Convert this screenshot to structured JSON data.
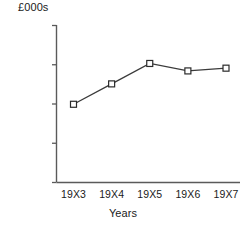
{
  "chart_data": {
    "type": "line",
    "title": "",
    "xlabel": "Years",
    "ylabel": "£000s",
    "categories": [
      "19X3",
      "19X4",
      "19X5",
      "19X6",
      "19X7"
    ],
    "values": [
      19800,
      25000,
      30200,
      28300,
      29000
    ],
    "series": [
      {
        "name": "",
        "values": [
          19800,
          25000,
          30200,
          28300,
          29000
        ]
      }
    ],
    "ylim": [
      0,
      40000
    ],
    "yticks": [
      0,
      10000,
      20000,
      30000,
      40000
    ],
    "ytick_labels": [
      "0",
      "10 000",
      "20 000",
      "30 000",
      "40 000"
    ],
    "grid": false,
    "legend": false,
    "legend_position": "none",
    "marker": "open-square",
    "line_color": "#3b3b3b",
    "marker_fill": "#ffffff",
    "marker_edge": "#2b2b2b",
    "axis_color": "#5a5a5a"
  }
}
